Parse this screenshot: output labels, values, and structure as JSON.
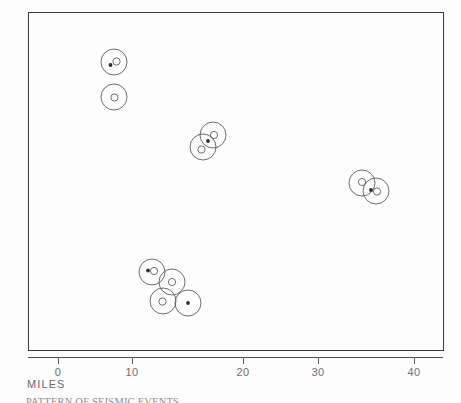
{
  "figure": {
    "axis_title": "MILES",
    "caption": "PATTERN OF SEISMIC EVENTS",
    "frame_color": "#3a3a3a",
    "symbol_color": "#5d5d5d",
    "label_color": "#6f6f6f"
  },
  "chart_data": {
    "type": "scatter",
    "title": "",
    "xlabel": "MILES",
    "ylabel": "",
    "xlim": [
      -4,
      52
    ],
    "ylim": [
      0,
      46
    ],
    "grid": false,
    "legend": null,
    "xticks": [
      0,
      10,
      20,
      30,
      40
    ],
    "xtick_labels": [
      "0",
      "10",
      "20",
      "30",
      "40"
    ],
    "symbol_legend": [
      {
        "name": "ring",
        "desc": "large open circle (event halo)",
        "radius_px": 13
      },
      {
        "name": "open-circle",
        "desc": "small open circle at center",
        "radius_px": 3.6
      },
      {
        "name": "filled-dot",
        "desc": "small filled dot",
        "radius_px": 1.9
      }
    ],
    "points": [
      {
        "id": "c1",
        "x_px": 114,
        "y_px": 62,
        "x_mi": 7.6,
        "ring": true,
        "open_circle": [
          2.5,
          -0.5
        ],
        "dot": [
          -3.5,
          3.0
        ]
      },
      {
        "id": "c2",
        "x_px": 114,
        "y_px": 97,
        "x_mi": 7.6,
        "ring": true,
        "open_circle": [
          0.5,
          0.5
        ],
        "dot": null
      },
      {
        "id": "c3",
        "x_px": 213,
        "y_px": 135,
        "x_mi": 20.9,
        "ring": true,
        "open_circle": [
          1.0,
          0.0
        ],
        "dot": null
      },
      {
        "id": "c4",
        "x_px": 203,
        "y_px": 147,
        "x_mi": 19.6,
        "ring": true,
        "open_circle": [
          -1.5,
          2.5
        ],
        "dot": [
          5.0,
          -6.0
        ]
      },
      {
        "id": "c5",
        "x_px": 362,
        "y_px": 183,
        "x_mi": 41.0,
        "ring": true,
        "open_circle": [
          0.0,
          -1.0
        ],
        "dot": null
      },
      {
        "id": "c6",
        "x_px": 376,
        "y_px": 191,
        "x_mi": 42.9,
        "ring": true,
        "open_circle": [
          1.0,
          0.5
        ],
        "dot": [
          -5.0,
          -1.0
        ]
      },
      {
        "id": "c7",
        "x_px": 152,
        "y_px": 272,
        "x_mi": 12.7,
        "ring": true,
        "open_circle": [
          2.0,
          -1.0
        ],
        "dot": [
          -4.0,
          -1.5
        ]
      },
      {
        "id": "c8",
        "x_px": 172,
        "y_px": 282,
        "x_mi": 15.4,
        "ring": true,
        "open_circle": [
          0.0,
          0.0
        ],
        "dot": null
      },
      {
        "id": "c9",
        "x_px": 163,
        "y_px": 301,
        "x_mi": 14.2,
        "ring": true,
        "open_circle": [
          -0.5,
          0.5
        ],
        "dot": null
      },
      {
        "id": "c10",
        "x_px": 188,
        "y_px": 303,
        "x_mi": 17.6,
        "ring": true,
        "open_circle": null,
        "dot": [
          0.0,
          0.0
        ]
      }
    ],
    "clusters": [
      {
        "name": "northwest-pair",
        "count": 2
      },
      {
        "name": "central-pair",
        "count": 2
      },
      {
        "name": "east-pair",
        "count": 2
      },
      {
        "name": "south-group",
        "count": 4
      }
    ]
  }
}
